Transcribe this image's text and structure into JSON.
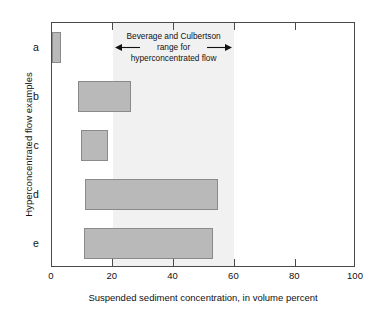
{
  "chart_data": {
    "type": "bar",
    "orientation": "horizontal",
    "title": "",
    "xlabel": "Suspended sediment concentration, in volume percent",
    "ylabel": "Hyperconcentrated flow examples",
    "xlim": [
      0,
      100
    ],
    "xticks": [
      0,
      20,
      40,
      60,
      80,
      100
    ],
    "xticklabels": [
      "0",
      "20",
      "40",
      "60",
      "80",
      "100"
    ],
    "grid": false,
    "legend": null,
    "categories": [
      "a",
      "b",
      "c",
      "d",
      "e"
    ],
    "bars": [
      {
        "category": "a",
        "start": 0.0,
        "end": 3.0
      },
      {
        "category": "b",
        "start": 8.5,
        "end": 26.0
      },
      {
        "category": "c",
        "start": 9.5,
        "end": 18.5
      },
      {
        "category": "d",
        "start": 11.0,
        "end": 54.5
      },
      {
        "category": "e",
        "start": 10.5,
        "end": 53.0
      }
    ],
    "shaded_band": {
      "label": "Beverage and Culbertson range for hyperconcentrated flow",
      "start": 20,
      "end": 60,
      "color": "#f1f1f1"
    },
    "annotation": {
      "line1": "Beverage and Culbertson",
      "line2": "range for",
      "line3": "hyperconcentrated flow",
      "left_arrow": "left-arrow",
      "right_arrow": "right-arrow"
    },
    "colors": {
      "bar_fill": "#b9b9b9",
      "bar_edge": "#8a8a8a",
      "axis": "#4a4a4a",
      "band": "#f1f1f1",
      "text": "#111111"
    }
  }
}
